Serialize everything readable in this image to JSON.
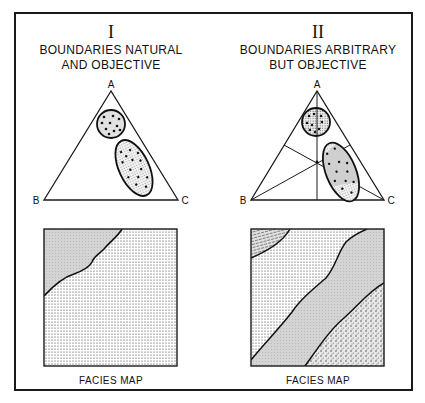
{
  "panels": [
    {
      "numeral": "I",
      "title_line1": "BOUNDARIES NATURAL",
      "title_line2": "AND OBJECTIVE",
      "vertices": {
        "top": "A",
        "left": "B",
        "right": "C"
      },
      "caption": "FACIES MAP"
    },
    {
      "numeral": "II",
      "title_line1": "BOUNDARIES ARBITRARY",
      "title_line2": "BUT OBJECTIVE",
      "vertices": {
        "top": "A",
        "left": "B",
        "right": "C"
      },
      "caption": "FACIES MAP"
    }
  ],
  "colors": {
    "line": "#1a1a1a",
    "light_stipple": "#d9d9d9",
    "mid_stipple": "#c8c8c8",
    "background": "#ffffff"
  }
}
